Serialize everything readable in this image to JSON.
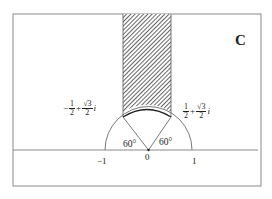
{
  "figure": {
    "panel_label": "C",
    "colors": {
      "frame": "#8a8a8a",
      "axis": "#8a8a8a",
      "lines": "#6a6a6a",
      "hatch": "#3a3a3a",
      "text": "#222222"
    }
  },
  "axis": {
    "ticks": [
      {
        "label": "−1",
        "value": -1
      },
      {
        "label": "0",
        "value": 0
      },
      {
        "label": "1",
        "value": 1
      }
    ]
  },
  "points": {
    "left": {
      "sign": "−",
      "re_num": "1",
      "re_den": "2",
      "plus": "+",
      "im_num": "√3",
      "im_den": "2",
      "unit": "i"
    },
    "right": {
      "sign": "",
      "re_num": "1",
      "re_den": "2",
      "plus": "+",
      "im_num": "√3",
      "im_den": "2",
      "unit": "i"
    }
  },
  "angles": {
    "left": "60°",
    "right": "60°"
  }
}
